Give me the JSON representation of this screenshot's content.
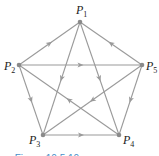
{
  "diagram": {
    "type": "directed-graph",
    "edge_color": "#9a9a9a",
    "node_color": "#8a8a8a",
    "nodes": [
      {
        "id": "P1",
        "label": "P",
        "sub": "1",
        "x": 80,
        "y": 22,
        "lx": 76,
        "ly": 14
      },
      {
        "id": "P2",
        "label": "P",
        "sub": "2",
        "x": 19,
        "y": 65,
        "lx": 4,
        "ly": 70
      },
      {
        "id": "P3",
        "label": "P",
        "sub": "3",
        "x": 43,
        "y": 135,
        "lx": 29,
        "ly": 144
      },
      {
        "id": "P4",
        "label": "P",
        "sub": "4",
        "x": 119,
        "y": 135,
        "lx": 123,
        "ly": 144
      },
      {
        "id": "P5",
        "label": "P",
        "sub": "5",
        "x": 142,
        "y": 65,
        "lx": 146,
        "ly": 70
      }
    ],
    "edges": [
      {
        "from": "P2",
        "to": "P1"
      },
      {
        "from": "P5",
        "to": "P1"
      },
      {
        "from": "P2",
        "to": "P5"
      },
      {
        "from": "P1",
        "to": "P3"
      },
      {
        "from": "P1",
        "to": "P4"
      },
      {
        "from": "P2",
        "to": "P3"
      },
      {
        "from": "P5",
        "to": "P4"
      },
      {
        "from": "P4",
        "to": "P2"
      },
      {
        "from": "P5",
        "to": "P3"
      },
      {
        "from": "P3",
        "to": "P4"
      }
    ],
    "caption": "▲ Figure 10.5.10"
  }
}
